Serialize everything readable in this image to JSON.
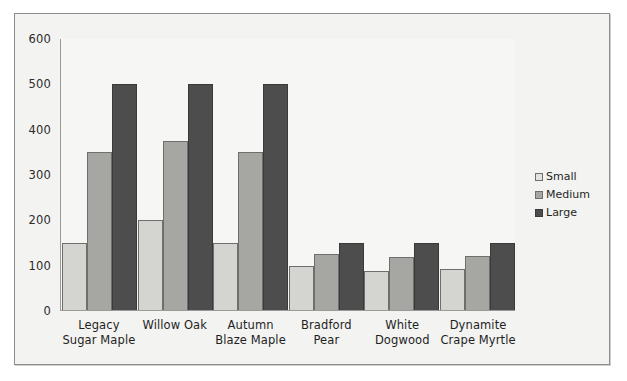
{
  "chart_data": {
    "type": "bar",
    "title": "",
    "xlabel": "",
    "ylabel": "",
    "ylim": [
      0,
      600
    ],
    "yticks": [
      0,
      100,
      200,
      300,
      400,
      500,
      600
    ],
    "grid": false,
    "legend_position": "right",
    "categories": [
      "Legacy Sugar Maple",
      "Willow Oak",
      "Autumn Blaze Maple",
      "Bradford Pear",
      "White Dogwood",
      "Dynamite Crape Myrtle"
    ],
    "series": [
      {
        "name": "Small",
        "color": "#d4d4d0",
        "values": [
          150,
          200,
          150,
          100,
          88,
          93
        ]
      },
      {
        "name": "Medium",
        "color": "#a6a6a2",
        "values": [
          350,
          375,
          350,
          125,
          120,
          122
        ]
      },
      {
        "name": "Large",
        "color": "#4d4d4d",
        "values": [
          500,
          500,
          500,
          150,
          150,
          150
        ]
      }
    ]
  },
  "legend": {
    "items": [
      {
        "label": "Small"
      },
      {
        "label": "Medium"
      },
      {
        "label": "Large"
      }
    ]
  }
}
